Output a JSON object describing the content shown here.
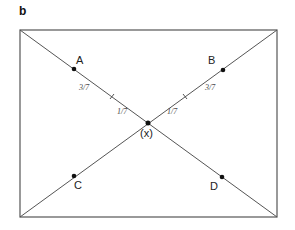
{
  "panel_label": "b",
  "rectangle": {
    "left": 20,
    "top": 30,
    "right": 277,
    "bottom": 217
  },
  "center": {
    "x": 148,
    "y": 123,
    "label": "(x)"
  },
  "points": [
    {
      "label": "A",
      "x": 74,
      "y": 69
    },
    {
      "label": "B",
      "x": 223,
      "y": 70
    },
    {
      "label": "C",
      "x": 74,
      "y": 176
    },
    {
      "label": "D",
      "x": 222,
      "y": 177
    }
  ],
  "segment_labels": {
    "outer_left": "3/7",
    "inner_left": "1/7",
    "inner_right": "1/7",
    "outer_right": "3/7"
  },
  "colors": {
    "line": "#555555",
    "point": "#111111"
  }
}
